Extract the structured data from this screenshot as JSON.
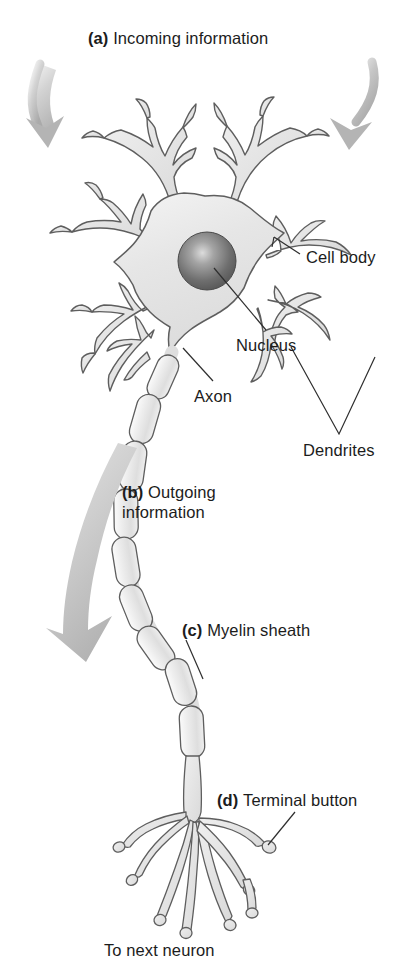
{
  "figure": {
    "title_visible": false,
    "background": "#ffffff",
    "palette": {
      "outline": "#5a5a5a",
      "cell_fill": "#e9e9e9",
      "myelin_fill": "#e3e3e3",
      "nucleus_dark": "#4a4a4a",
      "nucleus_light": "#c9c9c9",
      "arrow_gray": "#b5b5b5",
      "text": "#1c1c1c",
      "leader_line": "#3a3a3a"
    }
  },
  "labels": {
    "incoming": {
      "marker": "(a)",
      "text": "Incoming information"
    },
    "cell_body": {
      "marker": "",
      "text": "Cell body"
    },
    "nucleus": {
      "marker": "",
      "text": "Nucleus"
    },
    "axon": {
      "marker": "",
      "text": "Axon"
    },
    "dendrites": {
      "marker": "",
      "text": "Dendrites"
    },
    "outgoing": {
      "marker": "(b)",
      "text": "Outgoing information"
    },
    "myelin": {
      "marker": "(c)",
      "text": "Myelin sheath"
    },
    "terminal": {
      "marker": "(d)",
      "text": "Terminal button"
    },
    "to_next_neuron": {
      "marker": "",
      "text": "To next neuron"
    }
  },
  "parts": {
    "soma": "cell-body-soma",
    "nucleus": "nucleus-sphere",
    "dendrites": "dendrite-branches",
    "axon": "axon-shaft",
    "myelin_segments": 9,
    "terminal_buttons": "terminal-button-tree",
    "arrows": {
      "incoming_left": "incoming-arrow-left",
      "incoming_right": "incoming-arrow-right",
      "outgoing": "outgoing-arrow"
    }
  }
}
